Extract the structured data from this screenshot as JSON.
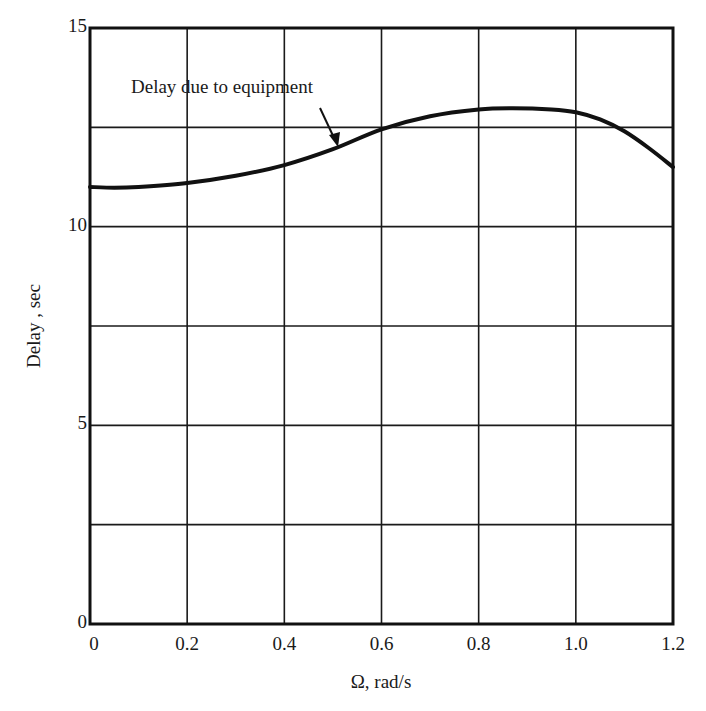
{
  "chart_data": {
    "type": "line",
    "title": "",
    "xlabel": "Ω, rad/s",
    "ylabel": "Delay , sec",
    "xlim": [
      0,
      1.2
    ],
    "ylim": [
      0,
      15
    ],
    "x_ticks": [
      0,
      0.2,
      0.4,
      0.6,
      0.8,
      1.0,
      1.2
    ],
    "x_tick_labels": [
      "0",
      "0.2",
      "0.4",
      "0.6",
      "0.8",
      "1.0",
      "1.2"
    ],
    "y_ticks": [
      0,
      2.5,
      5,
      7.5,
      10,
      12.5,
      15
    ],
    "y_tick_labels": [
      "0",
      "",
      "5",
      "",
      "10",
      "",
      "15"
    ],
    "grid": true,
    "legend": null,
    "series": [
      {
        "name": "Delay due to equipment",
        "x": [
          0,
          0.05,
          0.1,
          0.2,
          0.3,
          0.4,
          0.5,
          0.6,
          0.7,
          0.8,
          0.87,
          0.95,
          1.0,
          1.05,
          1.1,
          1.15,
          1.2
        ],
        "y": [
          11.0,
          10.98,
          11.0,
          11.1,
          11.28,
          11.55,
          11.95,
          12.45,
          12.78,
          12.95,
          12.98,
          12.95,
          12.88,
          12.7,
          12.4,
          11.98,
          11.5
        ]
      }
    ],
    "annotations": [
      {
        "text": "Delay due to equipment",
        "arrow_to": {
          "x": 0.5,
          "y": 12.0
        }
      }
    ],
    "colors": {
      "line": "#111111",
      "grid": "#1a1a1a",
      "background": "#ffffff"
    }
  }
}
